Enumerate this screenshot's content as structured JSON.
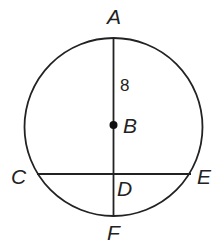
{
  "diagram": {
    "type": "circle-geometry",
    "stroke_color": "#222222",
    "background": "#ffffff",
    "circle": {
      "center_point": "B",
      "cx": 113.5,
      "cy": 127,
      "r": 89
    },
    "points": {
      "A": {
        "label": "A",
        "x": 113.5,
        "y": 38
      },
      "B": {
        "label": "B",
        "x": 113.5,
        "y": 125
      },
      "C": {
        "label": "C",
        "x": 37,
        "y": 174
      },
      "D": {
        "label": "D",
        "x": 113.5,
        "y": 174
      },
      "E": {
        "label": "E",
        "x": 191,
        "y": 174
      },
      "F": {
        "label": "F",
        "x": 113.5,
        "y": 216
      }
    },
    "segments": [
      {
        "from": "A",
        "to": "F",
        "name": "diameter-AF"
      },
      {
        "from": "C",
        "to": "E",
        "name": "chord-CE"
      }
    ],
    "measurements": [
      {
        "segment": "AB",
        "value": "8"
      }
    ]
  }
}
